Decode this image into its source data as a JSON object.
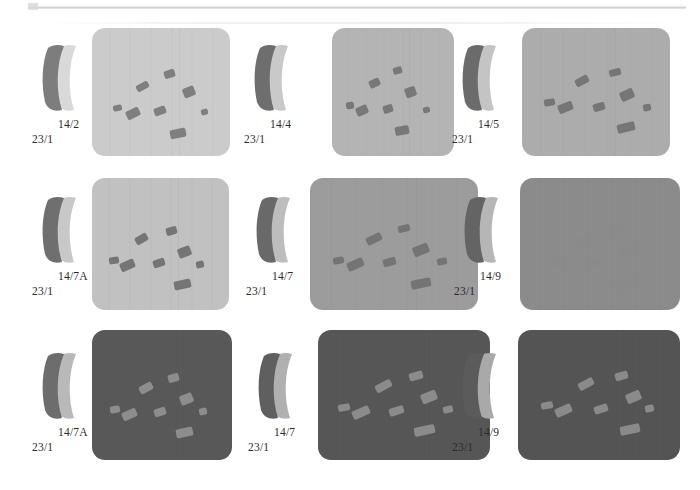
{
  "figure": {
    "layout": {
      "rows": 3,
      "columns": 3
    },
    "background_color": "#ffffff",
    "scan_artifact": true
  },
  "cells": [
    {
      "id": "cell-1",
      "sherd": {
        "icon": "pottery-sherd-profile-icon",
        "dark_color": "#7d7d7d",
        "light_color": "#d9d9d9"
      },
      "label_top": "14/2",
      "label_bottom": "23/1",
      "panel": {
        "background_color": "#cbcbcb",
        "grain_color": "#7f7f7f",
        "seam_color": "#b5b5b5",
        "contrast": "dark-grains-on-light",
        "grain_count": 8,
        "grains": [
          {
            "x": 45,
            "y": 56,
            "w": 13,
            "h": 7,
            "r": -28
          },
          {
            "x": 73,
            "y": 43,
            "w": 11,
            "h": 8,
            "r": -18
          },
          {
            "x": 92,
            "y": 60,
            "w": 12,
            "h": 10,
            "r": -22
          },
          {
            "x": 21,
            "y": 78,
            "w": 9,
            "h": 6,
            "r": -10
          },
          {
            "x": 34,
            "y": 82,
            "w": 14,
            "h": 9,
            "r": -26
          },
          {
            "x": 63,
            "y": 80,
            "w": 12,
            "h": 8,
            "r": -20
          },
          {
            "x": 111,
            "y": 82,
            "w": 7,
            "h": 6,
            "r": -14
          },
          {
            "x": 79,
            "y": 103,
            "w": 16,
            "h": 9,
            "r": -12
          }
        ]
      }
    },
    {
      "id": "cell-2",
      "sherd": {
        "icon": "pottery-sherd-profile-icon",
        "dark_color": "#6e6e6e",
        "light_color": "#c9c9c9"
      },
      "label_top": "14/4",
      "label_bottom": "23/1",
      "panel": {
        "background_color": "#b4b4b4",
        "grain_color": "#787878",
        "seam_color": "#a2a2a2",
        "contrast": "dark-grains-on-light",
        "grain_count": 8,
        "grains": [
          {
            "x": 42,
            "y": 52,
            "w": 13,
            "h": 8,
            "r": -26
          },
          {
            "x": 70,
            "y": 40,
            "w": 10,
            "h": 7,
            "r": -16
          },
          {
            "x": 84,
            "y": 60,
            "w": 13,
            "h": 10,
            "r": -20
          },
          {
            "x": 16,
            "y": 75,
            "w": 9,
            "h": 7,
            "r": -8
          },
          {
            "x": 28,
            "y": 79,
            "w": 14,
            "h": 9,
            "r": -24
          },
          {
            "x": 58,
            "y": 78,
            "w": 11,
            "h": 8,
            "r": -18
          },
          {
            "x": 104,
            "y": 80,
            "w": 8,
            "h": 6,
            "r": -12
          },
          {
            "x": 72,
            "y": 100,
            "w": 16,
            "h": 9,
            "r": -10
          }
        ]
      }
    },
    {
      "id": "cell-3",
      "sherd": {
        "icon": "pottery-sherd-profile-icon",
        "dark_color": "#6b6b6b",
        "light_color": "#c4c4c4"
      },
      "label_top": "14/5",
      "label_bottom": "23/1",
      "panel": {
        "background_color": "#acacac",
        "grain_color": "#767676",
        "seam_color": "#9b9b9b",
        "contrast": "dark-grains-on-light",
        "grain_count": 8,
        "grains": [
          {
            "x": 50,
            "y": 50,
            "w": 13,
            "h": 8,
            "r": -28
          },
          {
            "x": 82,
            "y": 42,
            "w": 11,
            "h": 7,
            "r": -14
          },
          {
            "x": 93,
            "y": 63,
            "w": 13,
            "h": 10,
            "r": -24
          },
          {
            "x": 21,
            "y": 72,
            "w": 10,
            "h": 7,
            "r": -10
          },
          {
            "x": 34,
            "y": 76,
            "w": 14,
            "h": 9,
            "r": -22
          },
          {
            "x": 67,
            "y": 76,
            "w": 11,
            "h": 8,
            "r": -16
          },
          {
            "x": 114,
            "y": 77,
            "w": 8,
            "h": 7,
            "r": -12
          },
          {
            "x": 90,
            "y": 96,
            "w": 17,
            "h": 9,
            "r": -14
          }
        ]
      }
    },
    {
      "id": "cell-4",
      "sherd": {
        "icon": "pottery-sherd-profile-icon",
        "dark_color": "#6f6f6f",
        "light_color": "#c8c8c8"
      },
      "label_top": "14/7A",
      "label_bottom": "23/1",
      "panel": {
        "background_color": "#c1c1c1",
        "grain_color": "#757575",
        "seam_color": "#aaaaaa",
        "contrast": "dark-grains-on-light",
        "grain_count": 8,
        "grains": [
          {
            "x": 44,
            "y": 56,
            "w": 13,
            "h": 8,
            "r": -30
          },
          {
            "x": 76,
            "y": 48,
            "w": 11,
            "h": 8,
            "r": -16
          },
          {
            "x": 88,
            "y": 68,
            "w": 13,
            "h": 10,
            "r": -22
          },
          {
            "x": 17,
            "y": 78,
            "w": 10,
            "h": 7,
            "r": -8
          },
          {
            "x": 29,
            "y": 82,
            "w": 15,
            "h": 9,
            "r": -24
          },
          {
            "x": 62,
            "y": 80,
            "w": 12,
            "h": 8,
            "r": -18
          },
          {
            "x": 106,
            "y": 82,
            "w": 8,
            "h": 7,
            "r": -12
          },
          {
            "x": 84,
            "y": 100,
            "w": 17,
            "h": 9,
            "r": -12
          }
        ]
      }
    },
    {
      "id": "cell-5",
      "sherd": {
        "icon": "pottery-sherd-profile-icon",
        "dark_color": "#696969",
        "light_color": "#bdbdbd"
      },
      "label_top": "14/7",
      "label_bottom": "23/1",
      "panel": {
        "background_color": "#9c9c9c",
        "grain_color": "#747474",
        "seam_color": "#8c8c8c",
        "contrast": "dark-grains-on-light",
        "grain_count": 8,
        "grains": [
          {
            "x": 47,
            "y": 56,
            "w": 13,
            "h": 8,
            "r": -26
          },
          {
            "x": 73,
            "y": 46,
            "w": 10,
            "h": 7,
            "r": -14
          },
          {
            "x": 86,
            "y": 66,
            "w": 13,
            "h": 10,
            "r": -22
          },
          {
            "x": 19,
            "y": 78,
            "w": 9,
            "h": 7,
            "r": -10
          },
          {
            "x": 31,
            "y": 81,
            "w": 14,
            "h": 9,
            "r": -24
          },
          {
            "x": 61,
            "y": 79,
            "w": 11,
            "h": 8,
            "r": -16
          },
          {
            "x": 106,
            "y": 79,
            "w": 8,
            "h": 7,
            "r": -12
          },
          {
            "x": 84,
            "y": 99,
            "w": 17,
            "h": 9,
            "r": -12
          }
        ]
      }
    },
    {
      "id": "cell-6",
      "sherd": {
        "icon": "pottery-sherd-profile-icon",
        "dark_color": "#646464",
        "light_color": "#b6b6b6"
      },
      "label_top": "14/9",
      "label_bottom": "23/1",
      "panel": {
        "background_color": "#8b8b8b",
        "grain_color": "#888888",
        "seam_color": "#838383",
        "contrast": "very-low-contrast",
        "grain_count": 6,
        "grains": [
          {
            "x": 46,
            "y": 58,
            "w": 13,
            "h": 8,
            "r": -26
          },
          {
            "x": 76,
            "y": 48,
            "w": 11,
            "h": 7,
            "r": -14
          },
          {
            "x": 88,
            "y": 68,
            "w": 12,
            "h": 9,
            "r": -22
          },
          {
            "x": 24,
            "y": 80,
            "w": 13,
            "h": 9,
            "r": -24
          },
          {
            "x": 62,
            "y": 80,
            "w": 11,
            "h": 8,
            "r": -16
          },
          {
            "x": 84,
            "y": 100,
            "w": 16,
            "h": 9,
            "r": -12
          }
        ]
      }
    },
    {
      "id": "cell-7",
      "sherd": {
        "icon": "pottery-sherd-profile-icon",
        "dark_color": "#6d6d6d",
        "light_color": "#b9b9b9"
      },
      "label_top": "14/7A",
      "label_bottom": "23/1",
      "panel": {
        "background_color": "#585858",
        "grain_color": "#8d8d8d",
        "seam_color": "#636363",
        "contrast": "light-grains-on-dark",
        "grain_count": 8,
        "grains": [
          {
            "x": 47,
            "y": 54,
            "w": 14,
            "h": 8,
            "r": -28
          },
          {
            "x": 76,
            "y": 44,
            "w": 11,
            "h": 8,
            "r": -16
          },
          {
            "x": 88,
            "y": 64,
            "w": 13,
            "h": 10,
            "r": -22
          },
          {
            "x": 18,
            "y": 76,
            "w": 10,
            "h": 7,
            "r": -10
          },
          {
            "x": 30,
            "y": 80,
            "w": 15,
            "h": 9,
            "r": -24
          },
          {
            "x": 62,
            "y": 78,
            "w": 12,
            "h": 8,
            "r": -18
          },
          {
            "x": 107,
            "y": 78,
            "w": 8,
            "h": 7,
            "r": -12
          },
          {
            "x": 84,
            "y": 98,
            "w": 17,
            "h": 9,
            "r": -12
          }
        ]
      }
    },
    {
      "id": "cell-8",
      "sherd": {
        "icon": "pottery-sherd-profile-icon",
        "dark_color": "#5f5f5f",
        "light_color": "#b0b0b0"
      },
      "label_top": "14/7",
      "label_bottom": "23/1",
      "panel": {
        "background_color": "#565656",
        "grain_color": "#8b8b8b",
        "seam_color": "#616161",
        "contrast": "light-grains-on-dark",
        "grain_count": 8,
        "grains": [
          {
            "x": 46,
            "y": 52,
            "w": 14,
            "h": 8,
            "r": -28
          },
          {
            "x": 74,
            "y": 42,
            "w": 11,
            "h": 8,
            "r": -16
          },
          {
            "x": 84,
            "y": 62,
            "w": 13,
            "h": 10,
            "r": -22
          },
          {
            "x": 16,
            "y": 74,
            "w": 10,
            "h": 7,
            "r": -10
          },
          {
            "x": 28,
            "y": 78,
            "w": 15,
            "h": 9,
            "r": -24
          },
          {
            "x": 58,
            "y": 77,
            "w": 12,
            "h": 8,
            "r": -18
          },
          {
            "x": 102,
            "y": 76,
            "w": 8,
            "h": 7,
            "r": -12
          },
          {
            "x": 78,
            "y": 96,
            "w": 17,
            "h": 9,
            "r": -12
          }
        ]
      }
    },
    {
      "id": "cell-9",
      "sherd": {
        "icon": "pottery-sherd-profile-icon",
        "dark_color": "#5b5b5b",
        "light_color": "#a9a9a9"
      },
      "label_top": "14/9",
      "label_bottom": "23/1",
      "panel": {
        "background_color": "#545454",
        "grain_color": "#8a8a8a",
        "seam_color": "#5f5f5f",
        "contrast": "light-grains-on-dark",
        "grain_count": 8,
        "grains": [
          {
            "x": 52,
            "y": 50,
            "w": 14,
            "h": 8,
            "r": -28
          },
          {
            "x": 84,
            "y": 42,
            "w": 11,
            "h": 8,
            "r": -16
          },
          {
            "x": 93,
            "y": 62,
            "w": 13,
            "h": 10,
            "r": -22
          },
          {
            "x": 20,
            "y": 72,
            "w": 10,
            "h": 7,
            "r": -10
          },
          {
            "x": 32,
            "y": 76,
            "w": 15,
            "h": 9,
            "r": -24
          },
          {
            "x": 66,
            "y": 75,
            "w": 12,
            "h": 8,
            "r": -18
          },
          {
            "x": 110,
            "y": 75,
            "w": 8,
            "h": 7,
            "r": -12
          },
          {
            "x": 88,
            "y": 95,
            "w": 17,
            "h": 9,
            "r": -12
          }
        ]
      }
    }
  ]
}
